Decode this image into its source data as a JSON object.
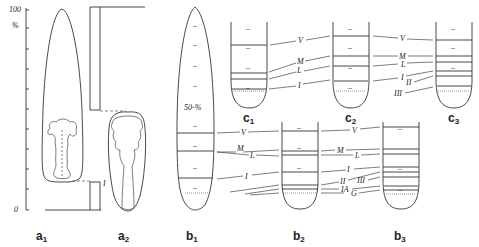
{
  "figure": {
    "axis": {
      "top_label": "100",
      "unit_label": "%",
      "bottom_label": "0",
      "tick_count": 11
    },
    "panels": {
      "a1": {
        "letter": "a",
        "sub": "1"
      },
      "a2": {
        "letter": "a",
        "sub": "2"
      },
      "b1": {
        "letter": "b",
        "sub": "1",
        "inner_label": "50-%"
      },
      "b2": {
        "letter": "b",
        "sub": "2"
      },
      "b3": {
        "letter": "b",
        "sub": "3"
      },
      "c1": {
        "letter": "c",
        "sub": "1"
      },
      "c2": {
        "letter": "c",
        "sub": "2"
      },
      "c3": {
        "letter": "c",
        "sub": "3"
      }
    },
    "a_labels": {
      "I": "I"
    },
    "c_row_labels": {
      "V": "V",
      "M": "M",
      "L": "L",
      "I": "I",
      "II": "II",
      "III": "III"
    },
    "b_row_labels": {
      "V": "V",
      "M": "M",
      "L": "L",
      "I": "I",
      "II": "II",
      "III": "III",
      "IA": "IA",
      "G": "G"
    }
  }
}
